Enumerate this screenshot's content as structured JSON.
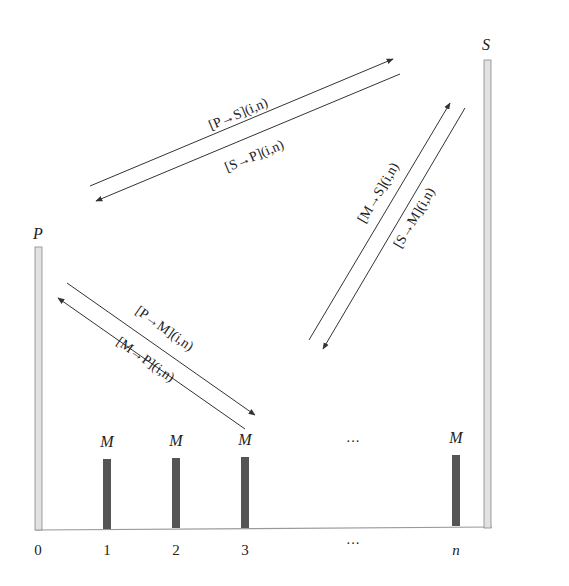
{
  "diagram": {
    "type": "message-flow",
    "nodes": {
      "P": {
        "label": "P",
        "position": "0"
      },
      "S": {
        "label": "S",
        "position": "right"
      },
      "M": [
        {
          "label": "M",
          "position": "1"
        },
        {
          "label": "M",
          "position": "2"
        },
        {
          "label": "M",
          "position": "3"
        },
        {
          "label": "M",
          "position": "n"
        }
      ]
    },
    "top_ellipsis": "···",
    "axis": {
      "ticks": [
        "0",
        "1",
        "2",
        "3",
        "···",
        "n"
      ]
    },
    "edges": [
      {
        "id": "p-to-s",
        "label": "[P→S](i,n)",
        "from": "P",
        "to": "S"
      },
      {
        "id": "s-to-p",
        "label": "[S→P](i,n)",
        "from": "S",
        "to": "P"
      },
      {
        "id": "m-to-s",
        "label": "[M→S](i,n)",
        "from": "M",
        "to": "S"
      },
      {
        "id": "s-to-m",
        "label": "[S→M](i,n)",
        "from": "S",
        "to": "M"
      },
      {
        "id": "p-to-m",
        "label": "[P→M](i,n)",
        "from": "P",
        "to": "M"
      },
      {
        "id": "m-to-p",
        "label": "[M→P](i,n)",
        "from": "M",
        "to": "P"
      }
    ],
    "colors": {
      "line": "#333333",
      "pillar_fill": "#e2e2e2",
      "pillar_stroke": "#888888",
      "node_bar": "#555555",
      "baseline": "#999999"
    }
  }
}
